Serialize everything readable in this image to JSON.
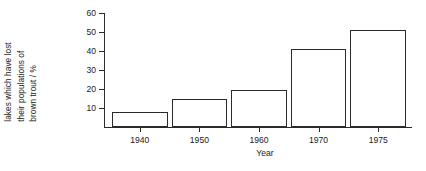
{
  "chart_data": {
    "type": "bar",
    "title": "",
    "xlabel": "Year",
    "ylabel": "lakes which have lost their populations of brown trout / %",
    "ylabel_lines": [
      "lakes which have lost",
      "their populations of",
      "brown trout / %"
    ],
    "categories": [
      "1940",
      "1950",
      "1960",
      "1970",
      "1975"
    ],
    "values": [
      8,
      15,
      19.5,
      41,
      51
    ],
    "ylim": [
      0,
      60
    ],
    "yticks": [
      10,
      20,
      30,
      40,
      50,
      60
    ],
    "ytick_labels": [
      "10",
      "20",
      "30",
      "40",
      "50",
      "60"
    ],
    "grid": false,
    "legend": false,
    "bar_fill_color": "#ffffff",
    "bar_edge_color": "#2b2b2b",
    "axis_color": "#2b2b2b",
    "background_color": "#ffffff"
  }
}
